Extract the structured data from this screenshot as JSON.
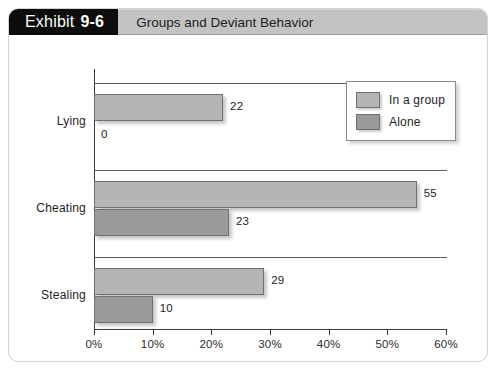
{
  "exhibit": {
    "badge_label": "Exhibit",
    "badge_number": "9-6",
    "title": "Groups and Deviant Behavior"
  },
  "legend": {
    "items": [
      {
        "label": "In a group",
        "color": "#b5b5b5"
      },
      {
        "label": "Alone",
        "color": "#9a9a9a"
      }
    ]
  },
  "chart_data": {
    "type": "bar",
    "orientation": "horizontal",
    "title": "Groups and Deviant Behavior",
    "xlabel": "",
    "ylabel": "",
    "categories": [
      "Lying",
      "Cheating",
      "Stealing"
    ],
    "series": [
      {
        "name": "In a group",
        "color": "#b5b5b5",
        "values": [
          22,
          55,
          29
        ]
      },
      {
        "name": "Alone",
        "color": "#9a9a9a",
        "values": [
          0,
          23,
          10
        ]
      }
    ],
    "value_labels": {
      "In a group": [
        "22",
        "55",
        "29"
      ],
      "Alone": [
        "0",
        "23",
        "10"
      ]
    },
    "xlim": [
      0,
      60
    ],
    "xtick_values": [
      0,
      10,
      20,
      30,
      40,
      50,
      60
    ],
    "xtick_labels": [
      "0%",
      "10%",
      "20%",
      "30%",
      "40%",
      "50%",
      "60%"
    ],
    "grid": false,
    "legend_position": "top-right",
    "value_unit": "%"
  }
}
